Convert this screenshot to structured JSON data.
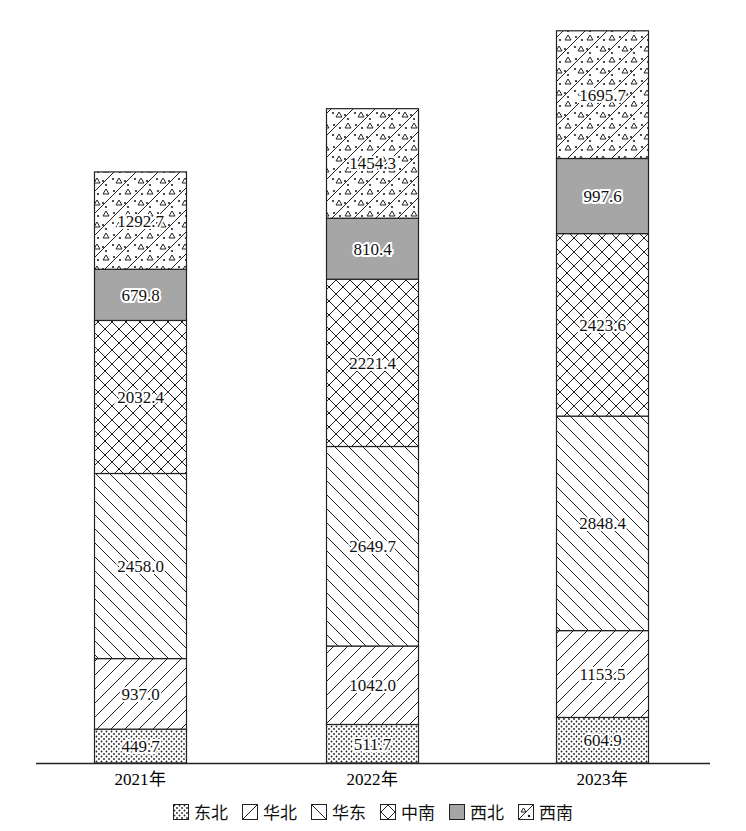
{
  "chart_data": {
    "type": "bar",
    "stacked": true,
    "title": "",
    "xlabel": "",
    "ylabel": "",
    "categories": [
      "2021年",
      "2022年",
      "2023年"
    ],
    "series": [
      {
        "name": "东北",
        "pattern": "dots",
        "values": [
          449.7,
          511.7,
          604.9
        ]
      },
      {
        "name": "华北",
        "pattern": "forward-diagonal",
        "values": [
          937.0,
          1042.0,
          1153.5
        ]
      },
      {
        "name": "华东",
        "pattern": "back-diagonal",
        "values": [
          2458.0,
          2649.7,
          2848.4
        ]
      },
      {
        "name": "中南",
        "pattern": "crosshatch",
        "values": [
          2032.4,
          2221.4,
          2423.6
        ]
      },
      {
        "name": "西北",
        "pattern": "solid-gray",
        "color": "#a6a6a6",
        "values": [
          679.8,
          810.4,
          997.6
        ]
      },
      {
        "name": "西南",
        "pattern": "triangles-dots-diagonal",
        "values": [
          1292.7,
          1454.3,
          1695.7
        ]
      }
    ],
    "data_labels": true,
    "grid": false,
    "y_axis_visible": false,
    "legend_position": "bottom"
  },
  "legend": {
    "items": [
      "东北",
      "华北",
      "华东",
      "中南",
      "西北",
      "西南"
    ]
  }
}
